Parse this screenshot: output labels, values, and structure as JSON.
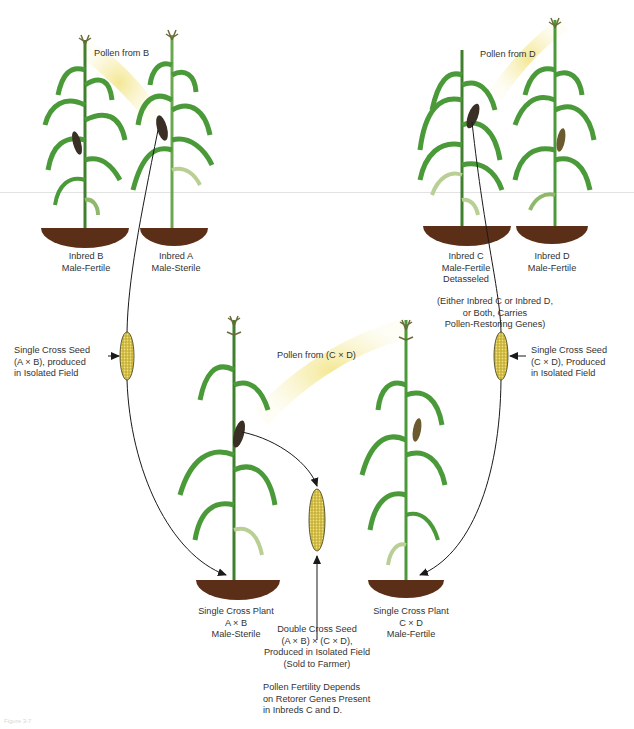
{
  "colors": {
    "leaf": "#4a9a3a",
    "leaf_dark": "#2f6f25",
    "leaf_pale": "#b9cf95",
    "soil": "#5a2e17",
    "pollen": "#f3e89a",
    "ear_dark": "#3a2f25",
    "seed": "#d9c54a",
    "line": "#1a1a1a"
  },
  "plants": {
    "inbred_b": {
      "line1": "Inbred B",
      "line2": "Male-Fertile"
    },
    "inbred_a": {
      "line1": "Inbred A",
      "line2": "Male-Sterile"
    },
    "inbred_c": {
      "line1": "Inbred C",
      "line2": "Male-Fertile",
      "line3": "Detasseled"
    },
    "inbred_d": {
      "line1": "Inbred D",
      "line2": "Male-Fertile"
    },
    "single_cross_ab": {
      "line1": "Single Cross Plant",
      "line2": "A × B",
      "line3": "Male-Sterile"
    },
    "single_cross_cd": {
      "line1": "Single Cross Plant",
      "line2": "C × D",
      "line3": "Male-Fertile"
    }
  },
  "pollen_labels": {
    "from_b": "Pollen from B",
    "from_d": "Pollen from D",
    "from_cd": "Pollen from (C × D)"
  },
  "notes": {
    "restoring": [
      "(Either Inbred C or Inbred D,",
      "or Both, Carries",
      "Pollen-Restoring Genes)"
    ],
    "seed_ab": [
      "Single Cross Seed",
      "(A × B), produced",
      "in Isolated Field"
    ],
    "seed_cd": [
      "Single Cross Seed",
      "(C × D), Produced",
      "in Isolated Field"
    ],
    "double_cross": [
      "Double Cross Seed",
      "(A × B) × (C × D),",
      "Produced in Isolated Field",
      "(Sold to Farmer)"
    ],
    "fertility": [
      "Pollen Fertility Depends",
      "on Retorer Genes Present",
      "in Inbreds C and D."
    ]
  },
  "caption": "Figure 3-7"
}
